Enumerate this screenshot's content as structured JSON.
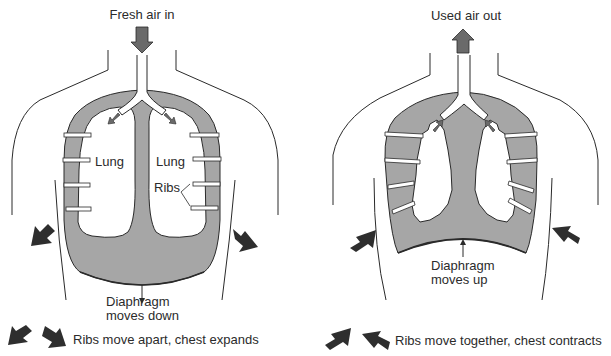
{
  "panels": [
    {
      "id": "inhale",
      "airflow_label": "Fresh air in",
      "lung_left_label": "Lung",
      "lung_right_label": "Lung",
      "ribs_label": "Ribs",
      "diaphragm_label_line1": "Diaphragm",
      "diaphragm_label_line2": "moves down",
      "caption": "Ribs move apart, chest expands",
      "airflow_direction": "down",
      "rib_direction": "outward"
    },
    {
      "id": "exhale",
      "airflow_label": "Used air out",
      "diaphragm_label_line1": "Diaphragm",
      "diaphragm_label_line2": "moves up",
      "caption": "Ribs move together, chest contracts",
      "airflow_direction": "up",
      "rib_direction": "inward"
    }
  ],
  "colors": {
    "cavity_fill": "#a6a6a6",
    "airflow_arrow": "#6a6a6a",
    "rib_arrow": "#2e2e2e",
    "outline": "#2a2a2a"
  }
}
